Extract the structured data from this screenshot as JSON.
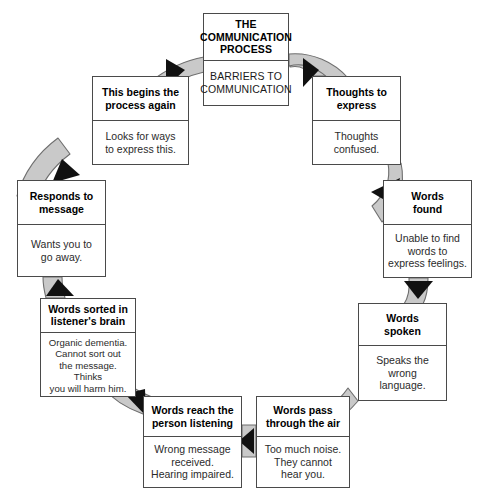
{
  "diagram": {
    "type": "cycle-flow",
    "title": "THE COMMUNICATION PROCESS",
    "colors": {
      "box_border": "#4a4a4a",
      "box_fill": "#ffffff",
      "arrow_band": "#c9c9c9",
      "arrow_band_border": "#6e6e6e",
      "arrow_head": "#111111",
      "title_text": "#000000",
      "body_text": "#2b2b2b"
    },
    "nodes": [
      {
        "id": "center",
        "title": "THE\nCOMMUNICATION\nPROCESS",
        "title_lines": [
          "THE",
          "COMMUNICATION",
          "PROCESS"
        ],
        "body": "BARRIERS TO\nCOMMUNICATION",
        "body_lines": [
          "BARRIERS TO",
          "COMMUNICATION"
        ]
      },
      {
        "id": "thoughts",
        "title": "Thoughts to\nexpress",
        "title_lines": [
          "Thoughts to",
          "express"
        ],
        "body": "Thoughts\nconfused.",
        "body_lines": [
          "Thoughts",
          "confused."
        ]
      },
      {
        "id": "wordsfound",
        "title": "Words\nfound",
        "title_lines": [
          "Words",
          "found"
        ],
        "body": "Unable to find\nwords to\nexpress feelings.",
        "body_lines": [
          "Unable to find",
          "words to",
          "express feelings."
        ]
      },
      {
        "id": "wordsspoken",
        "title": "Words\nspoken",
        "title_lines": [
          "Words",
          "spoken"
        ],
        "body": "Speaks the\nwrong\nlanguage.",
        "body_lines": [
          "Speaks the",
          "wrong",
          "language."
        ]
      },
      {
        "id": "air",
        "title": "Words pass\nthrough the air",
        "title_lines": [
          "Words pass",
          "through the air"
        ],
        "body": "Too much noise.\nThey cannot\nhear you.",
        "body_lines": [
          "Too much noise.",
          "They cannot",
          "hear you."
        ]
      },
      {
        "id": "reach",
        "title": "Words reach the\nperson listening",
        "title_lines": [
          "Words reach the",
          "person listening"
        ],
        "body": "Wrong message\nreceived.\nHearing impaired.",
        "body_lines": [
          "Wrong message",
          "received.",
          "Hearing impaired."
        ]
      },
      {
        "id": "sorted",
        "title": "Words sorted in\nlistener's brain",
        "title_lines": [
          "Words sorted in",
          "listener's brain"
        ],
        "body": "Organic dementia.\nCannot sort out\nthe message. Thinks\nyou will harm him.",
        "body_lines": [
          "Organic dementia.",
          "Cannot sort out",
          "the message. Thinks",
          "you will harm him."
        ]
      },
      {
        "id": "responds",
        "title": "Responds to\nmessage",
        "title_lines": [
          "Responds to",
          "message"
        ],
        "body": "Wants you to\ngo away.",
        "body_lines": [
          "Wants you to",
          "go away."
        ]
      },
      {
        "id": "begins",
        "title": "This begins the\nprocess again",
        "title_lines": [
          "This begins the",
          "process again"
        ],
        "body": "Looks for ways\nto express this.",
        "body_lines": [
          "Looks for ways",
          "to express this."
        ]
      }
    ],
    "edges": [
      {
        "id": "center-to-thoughts",
        "from": "center",
        "to": "thoughts",
        "name": "arrow-center-to-thoughts"
      },
      {
        "id": "thoughts-to-found",
        "from": "thoughts",
        "to": "wordsfound",
        "name": "arrow-thoughts-to-words-found"
      },
      {
        "id": "found-to-spoken",
        "from": "wordsfound",
        "to": "wordsspoken",
        "name": "arrow-words-found-to-words-spoken"
      },
      {
        "id": "spoken-to-air",
        "from": "wordsspoken",
        "to": "air",
        "name": "arrow-words-spoken-to-air"
      },
      {
        "id": "air-to-reach",
        "from": "air",
        "to": "reach",
        "name": "arrow-air-to-reach"
      },
      {
        "id": "reach-to-sorted",
        "from": "reach",
        "to": "sorted",
        "name": "arrow-reach-to-sorted"
      },
      {
        "id": "sorted-to-responds",
        "from": "sorted",
        "to": "responds",
        "name": "arrow-sorted-to-responds"
      },
      {
        "id": "responds-to-begins",
        "from": "responds",
        "to": "begins",
        "name": "arrow-responds-to-begins"
      },
      {
        "id": "begins-to-center",
        "from": "begins",
        "to": "center",
        "name": "arrow-begins-to-center"
      }
    ]
  }
}
